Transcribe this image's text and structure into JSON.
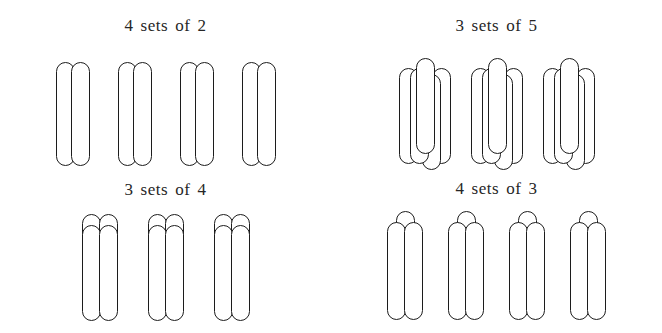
{
  "page": {
    "background_color": "#ffffff",
    "ink_color": "#1c1c1c"
  },
  "panels": [
    {
      "id": "top-left",
      "caption": "4 sets of 2",
      "sets": 4,
      "items_per_set": 3,
      "arrangement": "pair"
    },
    {
      "id": "top-right",
      "caption": "3 sets of 5",
      "sets": 3,
      "items_per_set": 5,
      "arrangement": "cross"
    },
    {
      "id": "bottom-left",
      "caption": "3 sets of 4",
      "sets": 3,
      "items_per_set": 4,
      "arrangement": "two-by-two"
    },
    {
      "id": "bottom-right",
      "caption": "4 sets of 3",
      "sets": 4,
      "items_per_set": 3,
      "arrangement": "triangle"
    }
  ]
}
